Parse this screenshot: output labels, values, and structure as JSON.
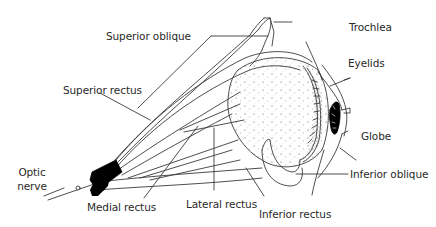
{
  "diagram": {
    "colors": {
      "line": "#3a3a3a",
      "fill_dark": "#000000",
      "stipple": "#555555",
      "text": "#2a2a2a"
    },
    "labels": {
      "superior_oblique": "Superior oblique",
      "trochlea": "Trochlea",
      "superior_rectus": "Superior rectus",
      "eyelids": "Eyelids",
      "globe": "Globe",
      "optic_nerve_line1": "Optic",
      "optic_nerve_line2": "nerve",
      "medial_rectus": "Medial rectus",
      "lateral_rectus": "Lateral rectus",
      "inferior_rectus": "Inferior rectus",
      "inferior_oblique": "Inferior oblique"
    }
  }
}
